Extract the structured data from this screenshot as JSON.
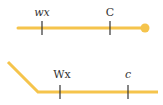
{
  "colors": {
    "line": "#f5c44c",
    "tick": "#333333",
    "text": "#333333"
  },
  "diagram1": {
    "labels": [
      {
        "text": "wx",
        "x": 42
      },
      {
        "text": "C",
        "x": 110
      }
    ]
  },
  "diagram2": {
    "labels": [
      {
        "text": "Wx",
        "x": 60
      },
      {
        "text": "c",
        "x": 128
      }
    ]
  }
}
